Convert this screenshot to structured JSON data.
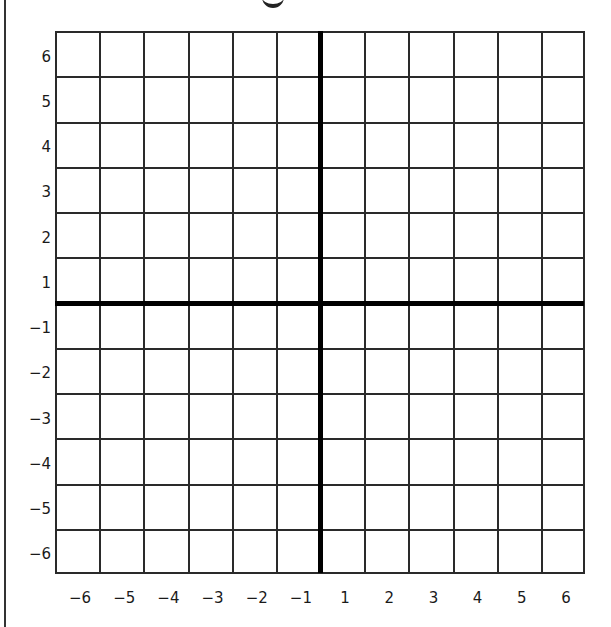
{
  "grid": {
    "x_min": -6,
    "x_max": 6,
    "y_min": -6,
    "y_max": 6,
    "columns": 12,
    "rows": 12,
    "origin_position": "axes cross between -1 and 1 (no zero label)"
  },
  "y_axis": {
    "tick_labels": [
      "6",
      "5",
      "4",
      "3",
      "2",
      "1",
      "−1",
      "−2",
      "−3",
      "−4",
      "−5",
      "−6"
    ]
  },
  "x_axis": {
    "tick_labels": [
      "−6",
      "−5",
      "−4",
      "−3",
      "−2",
      "−1",
      "1",
      "2",
      "3",
      "4",
      "5",
      "6"
    ]
  },
  "colors": {
    "grid_line": "#2a2a2a",
    "axis_line": "#000000",
    "background": "#ffffff"
  },
  "chart_data": {
    "type": "scatter",
    "title": "",
    "xlabel": "",
    "ylabel": "",
    "x_ticks": [
      -6,
      -5,
      -4,
      -3,
      -2,
      -1,
      1,
      2,
      3,
      4,
      5,
      6
    ],
    "y_ticks": [
      6,
      5,
      4,
      3,
      2,
      1,
      -1,
      -2,
      -3,
      -4,
      -5,
      -6
    ],
    "xlim": [
      -6,
      6
    ],
    "ylim": [
      -6,
      6
    ],
    "grid": true,
    "series": []
  }
}
